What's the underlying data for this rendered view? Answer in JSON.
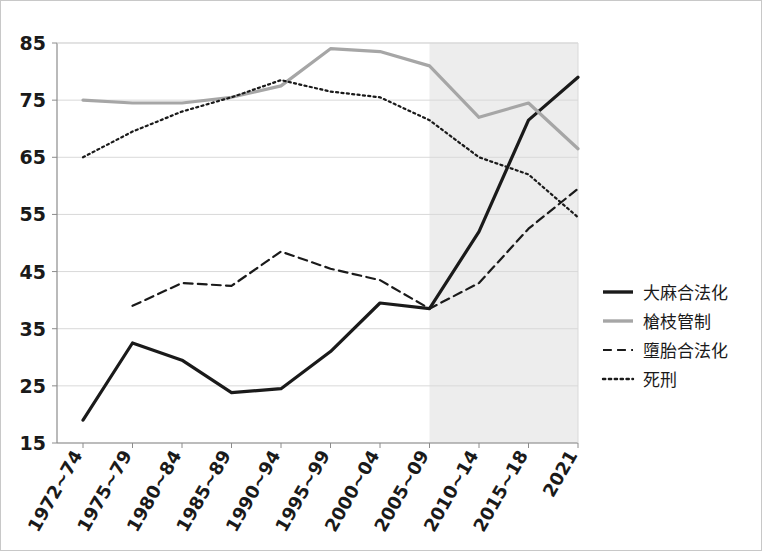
{
  "chart_data": {
    "type": "line",
    "title": "",
    "subtitle": "",
    "xlabel": "",
    "ylabel": "",
    "ylim": [
      15,
      85
    ],
    "ytick_step": 10,
    "yticks": [
      15,
      25,
      35,
      45,
      55,
      65,
      75,
      85
    ],
    "grid": true,
    "legend_position": "right",
    "categories": [
      "1972~74",
      "1975~79",
      "1980~84",
      "1985~89",
      "1990~94",
      "1995~99",
      "2000~04",
      "2005~09",
      "2010~14",
      "2015~18",
      "2021"
    ],
    "shaded_region": {
      "from_category": "2005~09",
      "to_category": "2021",
      "color": "#ededed"
    },
    "series": [
      {
        "name": "大麻合法化",
        "style": "solid",
        "color": "#1a1a1a",
        "width": 3.2,
        "values": [
          19.0,
          32.5,
          29.5,
          23.8,
          24.5,
          31.0,
          39.5,
          38.5,
          52.0,
          71.5,
          79.0
        ]
      },
      {
        "name": "槍枝管制",
        "style": "solid",
        "color": "#a6a6a6",
        "width": 3.2,
        "values": [
          75.0,
          74.5,
          74.5,
          75.5,
          77.5,
          84.0,
          83.5,
          81.0,
          72.0,
          74.5,
          66.5
        ]
      },
      {
        "name": "墮胎合法化",
        "style": "dashed",
        "color": "#1a1a1a",
        "width": 2.2,
        "values": [
          null,
          39.0,
          43.0,
          42.5,
          48.5,
          45.5,
          43.5,
          38.5,
          43.0,
          52.5,
          59.5
        ]
      },
      {
        "name": "死刑",
        "style": "dotted",
        "color": "#1a1a1a",
        "width": 2.2,
        "values": [
          65.0,
          69.5,
          73.0,
          75.5,
          78.5,
          76.5,
          75.5,
          71.5,
          65.0,
          62.0,
          54.5
        ]
      }
    ]
  },
  "legend": {
    "items": [
      {
        "label": "大麻合法化",
        "style": "solid",
        "color": "#1a1a1a",
        "width": 3.4
      },
      {
        "label": "槍枝管制",
        "style": "solid",
        "color": "#a6a6a6",
        "width": 3.4
      },
      {
        "label": "墮胎合法化",
        "style": "dashed",
        "color": "#1a1a1a",
        "width": 2.2
      },
      {
        "label": "死刑",
        "style": "dotted",
        "color": "#1a1a1a",
        "width": 2.4
      }
    ]
  },
  "colors": {
    "background": "#ffffff",
    "grid": "#d9d9d9",
    "axis": "#8c8c8c",
    "text": "#1a1a1a",
    "shade": "#ededed",
    "series_dark": "#1a1a1a",
    "series_gray": "#a6a6a6"
  }
}
